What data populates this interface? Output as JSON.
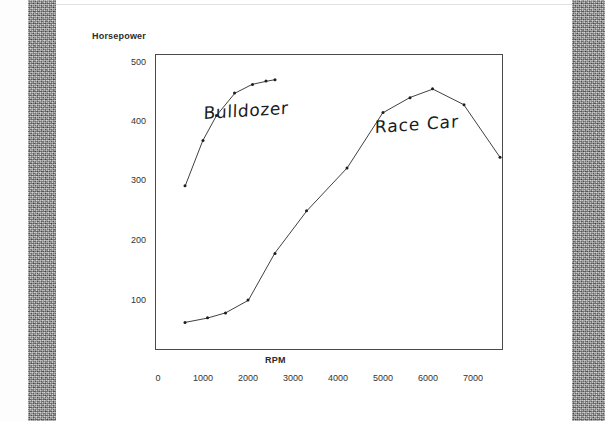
{
  "document": {
    "kind": "scanned-chart-page",
    "page_background": "#ffffff",
    "scan_band_color": "#8e8e8e"
  },
  "chart_data": {
    "type": "line",
    "title": "",
    "xlabel": "RPM",
    "ylabel": "Horsepower",
    "xlim": [
      0,
      7800
    ],
    "ylim": [
      0,
      540
    ],
    "grid": false,
    "legend": "inline-annotations",
    "x_ticks": [
      0,
      1000,
      2000,
      3000,
      4000,
      5000,
      6000,
      7000
    ],
    "x_tick_labels": [
      "0",
      "1000",
      "2000",
      "3000",
      "4000",
      "5000",
      "6000",
      "7000"
    ],
    "y_ticks": [
      100,
      200,
      300,
      400,
      500
    ],
    "y_tick_labels": [
      "100",
      "200",
      "300",
      "400",
      "500"
    ],
    "marker": "dot",
    "line_color": "#2a2a2a",
    "series": [
      {
        "name": "Bulldozer",
        "annotation": "Bulldozer",
        "x": [
          600,
          1000,
          1300,
          1700,
          2100,
          2400,
          2600
        ],
        "y": [
          292,
          368,
          410,
          448,
          462,
          468,
          470
        ]
      },
      {
        "name": "Race Car",
        "annotation": "Race Car",
        "x": [
          600,
          1100,
          1500,
          2000,
          2600,
          3300,
          4200,
          5000,
          5600,
          6100,
          6800,
          7600
        ],
        "y": [
          62,
          70,
          78,
          100,
          178,
          250,
          322,
          415,
          440,
          455,
          428,
          340
        ]
      }
    ]
  },
  "annotations": {
    "bulldozer": "Bulldozer",
    "race_car": "Race Car"
  }
}
